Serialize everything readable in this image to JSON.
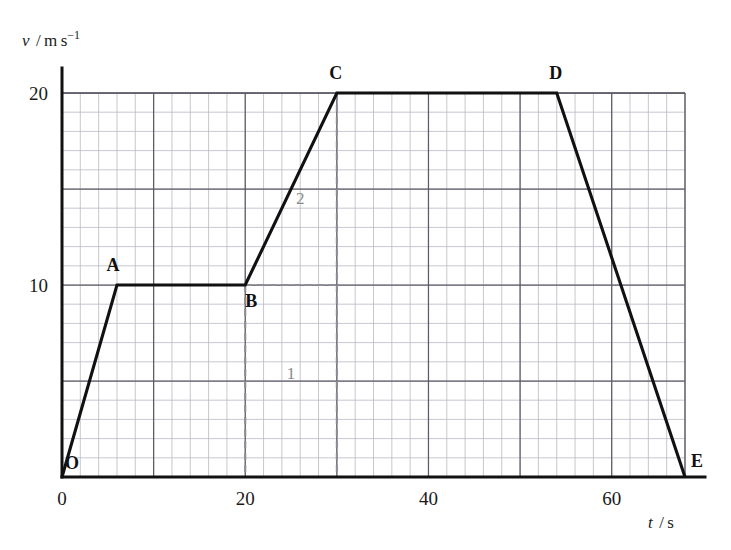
{
  "chart_data": {
    "type": "line",
    "title": "",
    "xlabel": "t / s",
    "ylabel": "v / m s⁻¹",
    "xlabel_symbol": "t",
    "xlabel_unit": "/ s",
    "ylabel_symbol": "v",
    "ylabel_unit": "/ m s",
    "ylabel_exponent": "−1",
    "xlim": [
      0,
      68
    ],
    "ylim": [
      0,
      20
    ],
    "x_tick_labels": [
      "0",
      "20",
      "40",
      "60"
    ],
    "x_tick_values": [
      0,
      20,
      40,
      60
    ],
    "y_tick_labels": [
      "10",
      "20"
    ],
    "y_tick_values": [
      10,
      20
    ],
    "x_major_step": 10,
    "x_minor_step": 2,
    "y_major_step": 5,
    "y_minor_step": 1,
    "grid": true,
    "legend": "none",
    "series": [
      {
        "name": "velocity",
        "x": [
          0,
          6,
          20,
          30,
          54,
          68
        ],
        "y": [
          0,
          10,
          10,
          20,
          20,
          0
        ]
      }
    ],
    "point_labels": [
      {
        "id": "O",
        "text": "O",
        "t": 0,
        "v": 0,
        "dx": 10,
        "dy": -8
      },
      {
        "id": "A",
        "text": "A",
        "t": 6,
        "v": 10,
        "dx": -4,
        "dy": -14
      },
      {
        "id": "B",
        "text": "B",
        "t": 20,
        "v": 10,
        "dx": 6,
        "dy": 22
      },
      {
        "id": "C",
        "text": "C",
        "t": 30,
        "v": 20,
        "dx": -1,
        "dy": -14
      },
      {
        "id": "D",
        "text": "D",
        "t": 54,
        "v": 20,
        "dx": -1,
        "dy": -14
      },
      {
        "id": "E",
        "text": "E",
        "t": 68,
        "v": 0,
        "dx": 12,
        "dy": -10
      }
    ],
    "region_labels": [
      {
        "id": "region-1",
        "text": "1",
        "t": 25,
        "v": 5.1
      },
      {
        "id": "region-2",
        "text": "2",
        "t": 26,
        "v": 14.2
      }
    ],
    "guides": [
      {
        "id": "guide-horizontal-v10",
        "points": [
          [
            20,
            10
          ],
          [
            30,
            10
          ]
        ]
      },
      {
        "id": "guide-vertical-t20",
        "points": [
          [
            20,
            10
          ],
          [
            20,
            0
          ]
        ]
      },
      {
        "id": "guide-vertical-t30",
        "points": [
          [
            30,
            20
          ],
          [
            30,
            0
          ]
        ]
      },
      {
        "id": "guide-baseline-20-30",
        "points": [
          [
            20,
            0
          ],
          [
            30,
            0
          ]
        ]
      }
    ],
    "colors": {
      "curve": "#111111",
      "guide": "#8d8d95",
      "minor_grid": "#b9b9c4",
      "major_grid": "#5c5c66",
      "axis": "#111111",
      "region_label": "#8a8a8a",
      "background": "#ffffff"
    }
  }
}
